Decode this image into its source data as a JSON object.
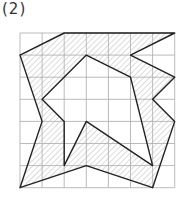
{
  "problem": {
    "label": "(2)"
  },
  "grid": {
    "cols": 7,
    "rows": 7,
    "origin_px": [
      20,
      33
    ],
    "cell_px": 22.1
  },
  "figure": {
    "outer_polygon": [
      [
        2,
        0
      ],
      [
        7,
        0
      ],
      [
        5,
        1
      ],
      [
        7,
        2
      ],
      [
        6,
        3
      ],
      [
        7,
        4
      ],
      [
        6,
        7
      ],
      [
        3,
        6
      ],
      [
        0,
        7
      ],
      [
        1,
        4
      ],
      [
        0,
        1
      ]
    ],
    "inner_polygon": [
      [
        3,
        1
      ],
      [
        5,
        2
      ],
      [
        6,
        6
      ],
      [
        3,
        4
      ],
      [
        2,
        6
      ],
      [
        2,
        4
      ],
      [
        1,
        3
      ]
    ],
    "fill": "hatched",
    "colors": {
      "grid": "#aaaaaa",
      "outline": "#222222",
      "hatch": "#b8b8b8"
    }
  }
}
